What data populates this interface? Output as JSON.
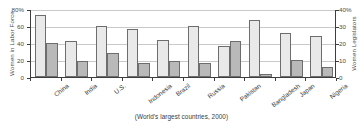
{
  "chart_data": {
    "type": "bar",
    "title": "",
    "caption": "(World's largest countries, 2000)",
    "categories": [
      "China",
      "India",
      "U.S.",
      "Indonesia",
      "Brazil",
      "Russia",
      "Pakistan",
      "Bangladesh",
      "Japan",
      "Nigeria"
    ],
    "series": [
      {
        "name": "Women in Labor Force",
        "axis": "left",
        "color": "#e9e9e9",
        "values": [
          73,
          42.5,
          60,
          56,
          44,
          60,
          37,
          67,
          51.5,
          48.5
        ]
      },
      {
        "name": "Women Legislators",
        "axis": "right",
        "color": "#b9b9b9",
        "values": [
          20,
          9.5,
          14,
          8,
          9.5,
          8.5,
          21,
          2,
          10,
          6
        ]
      }
    ],
    "left_axis": {
      "label": "Women in Labor Force",
      "ticks": [
        "0",
        "20",
        "40",
        "60",
        "80%"
      ],
      "tick_values": [
        0,
        20,
        40,
        60,
        80
      ],
      "ylim": [
        0,
        80
      ]
    },
    "right_axis": {
      "label": "Women Legislators",
      "ticks": [
        "0",
        "10",
        "20",
        "30",
        "40%"
      ],
      "tick_values": [
        0,
        10,
        20,
        30,
        40
      ],
      "ylim": [
        0,
        40
      ]
    },
    "grid": true,
    "legend": "none",
    "xlabel": ""
  }
}
